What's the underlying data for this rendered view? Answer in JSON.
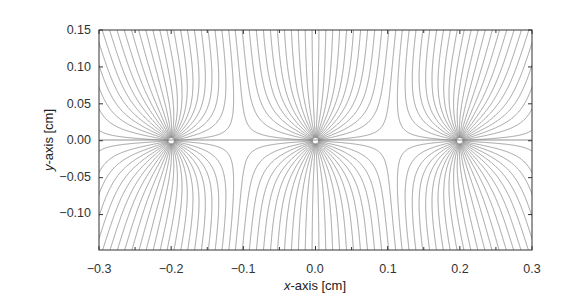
{
  "chart_data": {
    "type": "line",
    "title": "",
    "xlabel_italic": "x",
    "xlabel_rest": "-axis [cm]",
    "ylabel_italic": "y",
    "ylabel_rest": "-axis [cm]",
    "xlim": [
      -0.3,
      0.3
    ],
    "ylim": [
      -0.148,
      0.15
    ],
    "xticks": [
      -0.3,
      -0.2,
      -0.1,
      0.0,
      0.1,
      0.2,
      0.3
    ],
    "xtick_labels": [
      "−0.3",
      "−0.2",
      "−0.1",
      "0.0",
      "0.1",
      "0.2",
      "0.3"
    ],
    "xminor_ticks": [
      -0.25,
      -0.15,
      -0.05,
      0.05,
      0.15,
      0.25
    ],
    "yticks": [
      0.15,
      0.1,
      0.05,
      0.0,
      -0.05,
      -0.1
    ],
    "ytick_labels": [
      "0.15",
      "0.10",
      "0.05",
      "0.00",
      "−0.05",
      "−0.10"
    ],
    "sources": [
      {
        "x": -0.2,
        "y": 0.0
      },
      {
        "x": 0.0,
        "y": 0.0
      },
      {
        "x": 0.2,
        "y": 0.0
      }
    ],
    "period_cm": 0.2,
    "field_lines_per_source": 48,
    "field_line_style": "solid",
    "equipotential_style": "dashed",
    "line_color": "#7a7a7a",
    "grid": false,
    "legend": null
  },
  "colors": {
    "frame": "#333333",
    "lines": "#7a7a7a",
    "center_line": "#555555"
  }
}
